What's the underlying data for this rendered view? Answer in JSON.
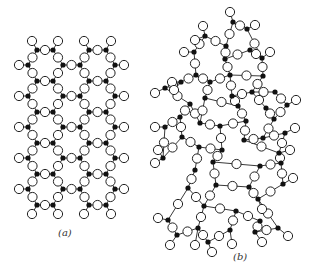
{
  "figure": {
    "panel_a": {
      "label": "(a)",
      "label_pos": [
        58,
        227
      ],
      "title": "crystalline network"
    },
    "panel_b": {
      "label": "(b)",
      "label_pos": [
        233,
        251
      ],
      "title": "random network"
    }
  },
  "colors": {
    "cation": "#111111",
    "oxygen_fill": "#ffffff",
    "oxygen_stroke": "#222222",
    "bond": "#222222"
  },
  "panel_a_lattice": {
    "rowsA_y": [
      50,
      81,
      112,
      143,
      174,
      205
    ],
    "rowsB_y": [
      65,
      96,
      127,
      158,
      189
    ],
    "rowA_x": [
      37,
      53,
      89,
      106
    ],
    "rowB_x": [
      28,
      63,
      80,
      115
    ],
    "cation_r": 2.6,
    "oxygen_r": 4.6
  },
  "panel_b_cations": [
    [
      233,
      22
    ],
    [
      205,
      36
    ],
    [
      247,
      29
    ],
    [
      226,
      46
    ],
    [
      250,
      50
    ],
    [
      194,
      52
    ],
    [
      262,
      58
    ],
    [
      225,
      59
    ],
    [
      230,
      75
    ],
    [
      263,
      76
    ],
    [
      196,
      75
    ],
    [
      181,
      82
    ],
    [
      210,
      82
    ],
    [
      165,
      88
    ],
    [
      205,
      98
    ],
    [
      232,
      96
    ],
    [
      252,
      92
    ],
    [
      275,
      92
    ],
    [
      190,
      104
    ],
    [
      238,
      106
    ],
    [
      266,
      108
    ],
    [
      287,
      105
    ],
    [
      180,
      117
    ],
    [
      246,
      121
    ],
    [
      200,
      123
    ],
    [
      274,
      119
    ],
    [
      165,
      127
    ],
    [
      220,
      126
    ],
    [
      244,
      140
    ],
    [
      263,
      138
    ],
    [
      285,
      133
    ],
    [
      182,
      137
    ],
    [
      199,
      147
    ],
    [
      222,
      150
    ],
    [
      279,
      153
    ],
    [
      163,
      158
    ],
    [
      195,
      170
    ],
    [
      213,
      162
    ],
    [
      260,
      166
    ],
    [
      281,
      163
    ],
    [
      188,
      188
    ],
    [
      216,
      185
    ],
    [
      249,
      187
    ],
    [
      258,
      199
    ],
    [
      283,
      184
    ],
    [
      204,
      206
    ],
    [
      236,
      211
    ],
    [
      260,
      221
    ],
    [
      168,
      220
    ],
    [
      177,
      235
    ],
    [
      198,
      228
    ],
    [
      208,
      242
    ],
    [
      230,
      230
    ],
    [
      255,
      232
    ],
    [
      278,
      228
    ]
  ],
  "panel_b_bonds": [
    [
      0,
      2
    ],
    [
      0,
      3
    ],
    [
      1,
      3
    ],
    [
      2,
      6
    ],
    [
      3,
      7
    ],
    [
      4,
      6
    ],
    [
      4,
      7
    ],
    [
      5,
      1
    ],
    [
      5,
      10
    ],
    [
      7,
      8
    ],
    [
      8,
      9
    ],
    [
      9,
      6
    ],
    [
      8,
      15
    ],
    [
      9,
      16
    ],
    [
      10,
      11
    ],
    [
      10,
      12
    ],
    [
      12,
      8
    ],
    [
      11,
      13
    ],
    [
      12,
      14
    ],
    [
      13,
      18
    ],
    [
      14,
      19
    ],
    [
      15,
      16
    ],
    [
      15,
      19
    ],
    [
      16,
      17
    ],
    [
      17,
      21
    ],
    [
      18,
      22
    ],
    [
      18,
      24
    ],
    [
      14,
      24
    ],
    [
      19,
      23
    ],
    [
      20,
      16
    ],
    [
      20,
      25
    ],
    [
      21,
      25
    ],
    [
      22,
      26
    ],
    [
      22,
      31
    ],
    [
      23,
      27
    ],
    [
      23,
      28
    ],
    [
      24,
      27
    ],
    [
      25,
      29
    ],
    [
      28,
      29
    ],
    [
      29,
      30
    ],
    [
      26,
      35
    ],
    [
      31,
      32
    ],
    [
      32,
      33
    ],
    [
      27,
      33
    ],
    [
      28,
      34
    ],
    [
      30,
      34
    ],
    [
      31,
      35
    ],
    [
      32,
      36
    ],
    [
      33,
      37
    ],
    [
      34,
      39
    ],
    [
      37,
      38
    ],
    [
      38,
      39
    ],
    [
      36,
      40
    ],
    [
      37,
      41
    ],
    [
      38,
      42
    ],
    [
      39,
      44
    ],
    [
      40,
      45
    ],
    [
      41,
      45
    ],
    [
      41,
      42
    ],
    [
      42,
      43
    ],
    [
      43,
      44
    ],
    [
      45,
      46
    ],
    [
      46,
      47
    ],
    [
      40,
      48
    ],
    [
      48,
      49
    ],
    [
      49,
      50
    ],
    [
      50,
      45
    ],
    [
      50,
      51
    ],
    [
      46,
      52
    ],
    [
      52,
      51
    ],
    [
      47,
      53
    ],
    [
      53,
      54
    ],
    [
      43,
      54
    ]
  ],
  "panel_b_terminals": [
    [
      [
        233,
        22
      ],
      [
        230,
        12
      ]
    ],
    [
      [
        205,
        36
      ],
      [
        203,
        26
      ]
    ],
    [
      [
        205,
        36
      ],
      [
        195,
        40
      ]
    ],
    [
      [
        247,
        29
      ],
      [
        255,
        25
      ]
    ],
    [
      [
        194,
        52
      ],
      [
        184,
        52
      ]
    ],
    [
      [
        262,
        58
      ],
      [
        270,
        52
      ]
    ],
    [
      [
        181,
        82
      ],
      [
        172,
        82
      ]
    ],
    [
      [
        165,
        88
      ],
      [
        155,
        93
      ]
    ],
    [
      [
        287,
        105
      ],
      [
        296,
        100
      ]
    ],
    [
      [
        165,
        127
      ],
      [
        155,
        127
      ]
    ],
    [
      [
        285,
        133
      ],
      [
        295,
        128
      ]
    ],
    [
      [
        163,
        158
      ],
      [
        155,
        163
      ]
    ],
    [
      [
        163,
        158
      ],
      [
        158,
        150
      ]
    ],
    [
      [
        279,
        153
      ],
      [
        290,
        150
      ]
    ],
    [
      [
        283,
        184
      ],
      [
        293,
        178
      ]
    ],
    [
      [
        258,
        199
      ],
      [
        262,
        209
      ]
    ],
    [
      [
        168,
        220
      ],
      [
        158,
        218
      ]
    ],
    [
      [
        177,
        235
      ],
      [
        170,
        245
      ]
    ],
    [
      [
        198,
        228
      ],
      [
        195,
        245
      ]
    ],
    [
      [
        208,
        242
      ],
      [
        212,
        252
      ]
    ],
    [
      [
        230,
        230
      ],
      [
        232,
        244
      ]
    ],
    [
      [
        255,
        232
      ],
      [
        262,
        242
      ]
    ],
    [
      [
        278,
        228
      ],
      [
        288,
        236
      ]
    ],
    [
      [
        181,
        82
      ],
      [
        174,
        90
      ]
    ]
  ]
}
